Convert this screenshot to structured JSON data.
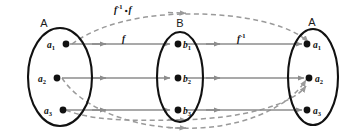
{
  "diagram": {
    "colors": {
      "ellipse_stroke": "#111111",
      "solid_arrow": "#8c8c8c",
      "dashed_arrow": "#9a9a9a",
      "dot": "#111111",
      "background": "#ffffff",
      "text": "#111111"
    },
    "sets": [
      {
        "id": "domain-a",
        "name": "A",
        "cx": 60,
        "cy": 77,
        "rx": 32,
        "ry": 49,
        "label_side": "left",
        "elements": [
          {
            "base": "a",
            "sub": "1",
            "x": 66,
            "y": 45
          },
          {
            "base": "a",
            "sub": "2",
            "x": 57,
            "y": 77
          },
          {
            "base": "a",
            "sub": "3",
            "x": 63,
            "y": 109
          }
        ]
      },
      {
        "id": "codomain-b",
        "name": "B",
        "cx": 180,
        "cy": 77,
        "rx": 23,
        "ry": 45,
        "label_side": "right",
        "elements": [
          {
            "base": "b",
            "sub": "1",
            "x": 178,
            "y": 45
          },
          {
            "base": "b",
            "sub": "2",
            "x": 178,
            "y": 77
          },
          {
            "base": "b",
            "sub": "3",
            "x": 178,
            "y": 109
          }
        ]
      },
      {
        "id": "range-a",
        "name": "A",
        "cx": 313,
        "cy": 77,
        "rx": 25,
        "ry": 48,
        "label_side": "right",
        "elements": [
          {
            "base": "a",
            "sub": "1",
            "x": 311,
            "y": 45
          },
          {
            "base": "a",
            "sub": "2",
            "x": 313,
            "y": 77
          },
          {
            "base": "a",
            "sub": "3",
            "x": 311,
            "y": 109
          }
        ]
      }
    ],
    "mappings": [
      {
        "id": "f",
        "label_base": "f",
        "label_sup": "",
        "style": "solid",
        "label_x": 122,
        "label_y": 42,
        "description": "f maps A to B"
      },
      {
        "id": "f-inverse",
        "label_base": "f",
        "label_sup": "-1",
        "style": "solid",
        "label_x": 240,
        "label_y": 42,
        "description": "f inverse maps B to A"
      },
      {
        "id": "f-inverse-compose-f",
        "label_base": "f",
        "label_sup": "-1",
        "label_ring": "∘",
        "label_base2": "f",
        "style": "dashed",
        "label_x": 122,
        "label_y": 13,
        "description": "f inverse composed with f maps A to A"
      }
    ],
    "set_name_positions": [
      {
        "text": "A",
        "x": 44,
        "y": 27
      },
      {
        "text": "B",
        "x": 180,
        "y": 27
      },
      {
        "text": "A",
        "x": 312,
        "y": 26
      }
    ]
  }
}
